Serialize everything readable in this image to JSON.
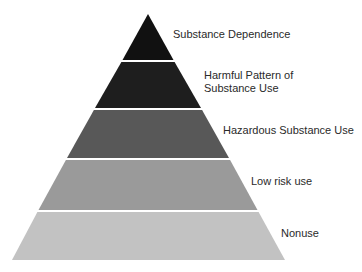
{
  "diagram": {
    "type": "pyramid",
    "levels": [
      {
        "label": "Substance Dependence",
        "color": "#111111"
      },
      {
        "label": "Harmful Pattern of\nSubstance Use",
        "color": "#1e1e1e"
      },
      {
        "label": "Hazardous Substance Use",
        "color": "#585858"
      },
      {
        "label": "Low risk use",
        "color": "#9a9a9a"
      },
      {
        "label": "Nonuse",
        "color": "#c2c2c2"
      }
    ]
  }
}
